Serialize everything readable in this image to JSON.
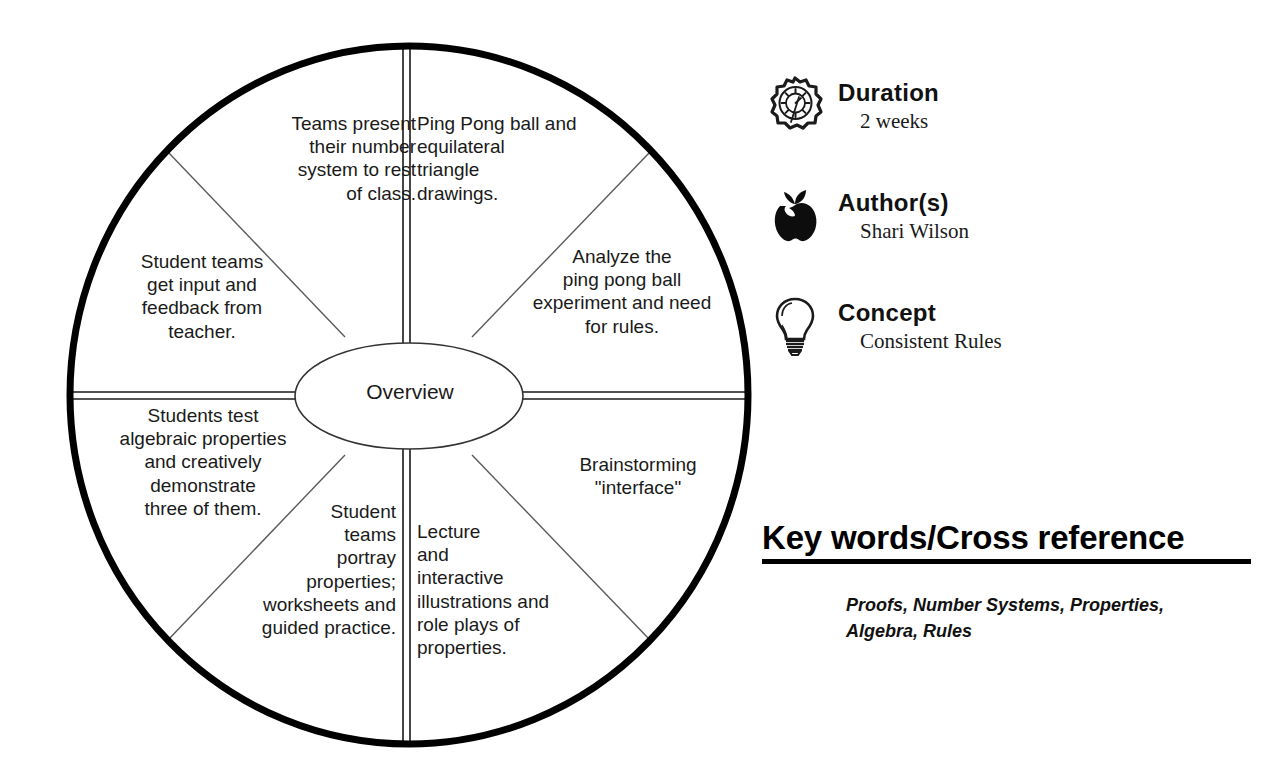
{
  "diagram": {
    "center_label": "Overview",
    "segments": [
      {
        "id": "teams-present",
        "align": "right",
        "text": "Teams present\ntheir number\nsystem to rest\nof class."
      },
      {
        "id": "ping-pong-ball",
        "align": "left",
        "text": "Ping Pong ball and\nequilateral\ntriangle\ndrawings."
      },
      {
        "id": "analyze-ping-pong",
        "align": "center",
        "text": "Analyze the\nping pong ball\nexperiment and need\nfor rules."
      },
      {
        "id": "brainstorming",
        "align": "center",
        "text": "Brainstorming\n\"interface\""
      },
      {
        "id": "lecture-interactive",
        "align": "left",
        "text": "Lecture\nand\ninteractive\nillustrations and\nrole plays of\nproperties."
      },
      {
        "id": "student-teams-portray",
        "align": "right",
        "text": "Student\nteams\nportray\nproperties;\nworksheets and\nguided practice."
      },
      {
        "id": "students-test-algebraic",
        "align": "center",
        "text": "Students test\nalgebraic properties\nand creatively\ndemonstrate\nthree of them."
      },
      {
        "id": "student-teams-input",
        "align": "center",
        "text": "Student teams\nget input and\nfeedback from\nteacher."
      }
    ]
  },
  "meta": {
    "rows": [
      {
        "icon": "clock-icon",
        "title": "Duration",
        "value": "2 weeks"
      },
      {
        "icon": "apple-icon",
        "title": "Author(s)",
        "value": "Shari Wilson"
      },
      {
        "icon": "lightbulb-icon",
        "title": "Concept",
        "value": "Consistent Rules"
      }
    ]
  },
  "keywords": {
    "heading": "Key words/Cross reference",
    "text": "Proofs, Number Systems, Properties, Algebra, Rules"
  },
  "colors": {
    "ink": "#000000",
    "background": "#ffffff",
    "thin_line": "#555555"
  }
}
